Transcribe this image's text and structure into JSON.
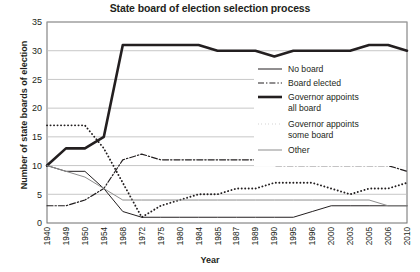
{
  "chart_data": {
    "type": "line",
    "title": "State board of election selection process",
    "xlabel": "Year",
    "ylabel": "Number of state boards of election",
    "ylim": [
      0,
      35
    ],
    "ytick_step": 5,
    "yticks": [
      0,
      5,
      10,
      15,
      20,
      25,
      30,
      35
    ],
    "grid": true,
    "legend_position": "right-inside",
    "categories": [
      "1940",
      "1949",
      "1950",
      "1954",
      "1968",
      "1972",
      "1975",
      "1980",
      "1984",
      "1985",
      "1987",
      "1989",
      "1990",
      "1995",
      "1996",
      "2000",
      "2003",
      "2005",
      "2006",
      "2010"
    ],
    "series": [
      {
        "name": "No board",
        "style": "solid-thin",
        "color": "#231f20",
        "values": [
          10,
          9,
          9,
          6,
          2,
          1,
          1,
          1,
          1,
          1,
          1,
          1,
          1,
          1,
          2,
          3,
          3,
          3,
          3,
          3
        ]
      },
      {
        "name": "Board elected",
        "style": "dash-dot",
        "color": "#231f20",
        "values": [
          3,
          3,
          4,
          6,
          11,
          12,
          11,
          11,
          11,
          11,
          11,
          11,
          10,
          10,
          10,
          10,
          10,
          10,
          10,
          9
        ]
      },
      {
        "name": "Governor appoints all board",
        "style": "solid-thick",
        "color": "#231f20",
        "values": [
          10,
          13,
          13,
          15,
          31,
          31,
          31,
          31,
          31,
          30,
          30,
          30,
          29,
          30,
          30,
          30,
          30,
          31,
          31,
          30
        ]
      },
      {
        "name": "Governor appoints some board",
        "style": "dotted",
        "color": "#231f20",
        "values": [
          17,
          17,
          17,
          13,
          7,
          1,
          3,
          4,
          5,
          5,
          6,
          6,
          7,
          7,
          7,
          6,
          5,
          6,
          6,
          7
        ]
      },
      {
        "name": "Other",
        "style": "solid-gray",
        "color": "#8d8d8d",
        "values": [
          10,
          9,
          8,
          6,
          4,
          4,
          4,
          4,
          4,
          4,
          4,
          4,
          4,
          4,
          4,
          4,
          4,
          4,
          3,
          3
        ]
      }
    ]
  },
  "legend": {
    "entries": [
      {
        "label": "No board"
      },
      {
        "label": "Board elected"
      },
      {
        "label": "Governor appoints"
      },
      {
        "label": "all board"
      },
      {
        "label": "Governor appoints"
      },
      {
        "label": "some board"
      },
      {
        "label": "Other"
      }
    ]
  }
}
